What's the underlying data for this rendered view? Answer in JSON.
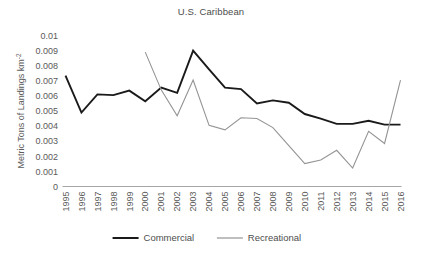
{
  "chart_data": {
    "type": "line",
    "title": "U.S. Caribbean",
    "xlabel": "",
    "ylabel": "Metric Tons of Landings km",
    "ylabel_exponent": "-2",
    "ylim": [
      0,
      0.01
    ],
    "ytick_labels": [
      "0",
      "0.001",
      "0.002",
      "0.003",
      "0.004",
      "0.005",
      "0.006",
      "0.007",
      "0.008",
      "0.009",
      "0.01"
    ],
    "ytick_values": [
      0,
      0.001,
      0.002,
      0.003,
      0.004,
      0.005,
      0.006,
      0.007,
      0.008,
      0.009,
      0.01
    ],
    "grid": false,
    "legend_position": "bottom",
    "categories": [
      1995,
      1996,
      1997,
      1998,
      1999,
      2000,
      2001,
      2002,
      2003,
      2004,
      2005,
      2006,
      2007,
      2008,
      2009,
      2010,
      2011,
      2012,
      2013,
      2014,
      2015,
      2016
    ],
    "xtick_labels": [
      "1995",
      "1996",
      "1997",
      "1998",
      "1999",
      "2000",
      "2001",
      "2002",
      "2003",
      "2004",
      "2005",
      "2006",
      "2007",
      "2008",
      "2009",
      "2010",
      "2011",
      "2012",
      "2013",
      "2014",
      "2015",
      "2016"
    ],
    "series": [
      {
        "name": "Commercial",
        "color": "#1a1a1a",
        "width": 1.9,
        "values": [
          0.00735,
          0.0049,
          0.0061,
          0.00605,
          0.00635,
          0.00565,
          0.00655,
          0.0062,
          0.009,
          0.00775,
          0.00655,
          0.00645,
          0.0055,
          0.0057,
          0.00555,
          0.0048,
          0.0045,
          0.00415,
          0.00415,
          0.00435,
          0.0041,
          0.0041
        ]
      },
      {
        "name": "Recreational",
        "color": "#949494",
        "width": 1.1,
        "values": [
          null,
          null,
          null,
          null,
          null,
          0.0089,
          0.0064,
          0.00468,
          0.00705,
          0.00405,
          0.00375,
          0.00455,
          0.0045,
          0.0039,
          0.0027,
          0.00152,
          0.00175,
          0.0024,
          0.00122,
          0.00365,
          0.00285,
          0.00705
        ]
      }
    ]
  },
  "legend": {
    "items": [
      {
        "label": "Commercial",
        "color": "#1a1a1a",
        "width": 2.0
      },
      {
        "label": "Recreational",
        "color": "#949494",
        "width": 1.2
      }
    ]
  },
  "axis": {
    "baseline_color": "#a6a6a6"
  }
}
